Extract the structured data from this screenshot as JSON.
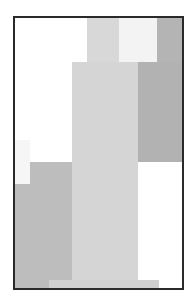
{
  "artwork": {
    "frame": {
      "left": 13,
      "top": 16,
      "width": 171,
      "height": 274,
      "border_color": "#2a2a2a",
      "background": "#ffffff"
    },
    "blocks": [
      {
        "name": "light-gray-top-column",
        "x": 72,
        "y": 0,
        "w": 34,
        "h": 44,
        "color": "#d8d8d8"
      },
      {
        "name": "off-white-top-block",
        "x": 104,
        "y": 0,
        "w": 38,
        "h": 44,
        "color": "#f3f3f3"
      },
      {
        "name": "dark-gray-top-right",
        "x": 142,
        "y": 0,
        "w": 27,
        "h": 44,
        "color": "#b4b4b4"
      },
      {
        "name": "light-gray-center-column",
        "x": 57,
        "y": 44,
        "w": 66,
        "h": 228,
        "color": "#d5d5d5"
      },
      {
        "name": "dark-gray-right-column",
        "x": 123,
        "y": 44,
        "w": 46,
        "h": 100,
        "color": "#b2b2b2"
      },
      {
        "name": "faint-white-left-notch",
        "x": 0,
        "y": 122,
        "w": 15,
        "h": 44,
        "color": "#f6f6f6"
      },
      {
        "name": "mid-gray-left-upper",
        "x": 15,
        "y": 144,
        "w": 42,
        "h": 128,
        "color": "#bdbdbd"
      },
      {
        "name": "mid-gray-left-lower",
        "x": 0,
        "y": 166,
        "w": 15,
        "h": 106,
        "color": "#bdbdbd"
      },
      {
        "name": "light-bottom-strip",
        "x": 34,
        "y": 262,
        "w": 110,
        "h": 10,
        "color": "#d0d0d0"
      }
    ]
  }
}
